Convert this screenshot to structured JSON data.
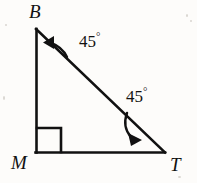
{
  "figure": {
    "kind": "geometry-diagram",
    "shape": "right-triangle",
    "background_color": "#fdfcfa",
    "stroke_color": "#111111",
    "vertices": [
      {
        "name": "B",
        "label": "B",
        "x": 36,
        "y": 29,
        "position": "top-left"
      },
      {
        "name": "M",
        "label": "M",
        "x": 36,
        "y": 152,
        "position": "bottom-left"
      },
      {
        "name": "T",
        "label": "T",
        "x": 164,
        "y": 152,
        "position": "bottom-right"
      }
    ],
    "sides": [
      {
        "name": "BM",
        "from": "B",
        "to": "M",
        "orientation": "vertical"
      },
      {
        "name": "MT",
        "from": "M",
        "to": "T",
        "orientation": "horizontal"
      },
      {
        "name": "BT",
        "from": "B",
        "to": "T",
        "orientation": "hypotenuse"
      }
    ],
    "right_angle": {
      "at": "M",
      "marker": "square",
      "size": 24,
      "x": 36,
      "y": 128
    },
    "angles": [
      {
        "at": "B",
        "value": "45",
        "degree_symbol": "°",
        "label": "45°",
        "arc_arrow": "arc-arrow-at-b",
        "arrow_direction": "toward-side-BM"
      },
      {
        "at": "T",
        "value": "45",
        "degree_symbol": "°",
        "label": "45°",
        "arc_arrow": "arc-arrow-at-t",
        "arrow_direction": "toward-side-MT"
      }
    ]
  }
}
